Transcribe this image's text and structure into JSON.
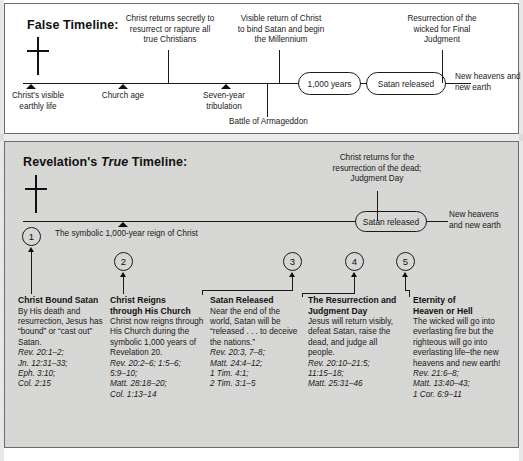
{
  "false_timeline": {
    "title": "False Timeline:",
    "cross_icon": "cross-icon",
    "above_labels": [
      "Christ returns secretly to\nresurrect or rapture all\ntrue Christians",
      "Visible return of Christ\nto bind Satan and begin\nthe Millennium",
      "Resurrection of the\nwicked for Final\nJudgment"
    ],
    "below_labels": [
      "Christ's visible\nearthly life",
      "Church age",
      "Seven-year\ntribulation",
      "Battle of Armageddon"
    ],
    "pills": [
      "1,000 years",
      "Satan released"
    ],
    "end_label": "New heavens and\nnew earth"
  },
  "true_timeline": {
    "title_prefix": "Revelation's ",
    "title_em": "True",
    "title_suffix": " Timeline:",
    "cross_icon": "cross-icon",
    "above_label": "Christ returns for the\nresurrection of the dead;\nJudgment Day",
    "reign_label": "The symbolic 1,000-year reign of Christ",
    "pill": "Satan released",
    "end_label": "New heavens\nand new earth",
    "markers": [
      "1",
      "2",
      "3",
      "4",
      "5"
    ]
  },
  "columns": [
    {
      "number": "1",
      "heading": "Christ Bound Satan",
      "body": "By His death and\nresurrection, Jesus has\n“bound” or “cast out”\nSatan.",
      "refs": "Rev. 20:1–2;\nJn. 12:31–33;\nEph. 3:10;\nCol. 2:15"
    },
    {
      "number": "2",
      "heading": "Christ Reigns\nthrough His Church",
      "body": "Christ now reigns through\nHis Church during the\nsymbolic 1,000 years of\nRevelation 20.",
      "refs": "Rev. 20:2–6; 1:5–6;\n5:9–10;\nMatt. 28:18–20;\nCol. 1:13–14"
    },
    {
      "number": "3",
      "heading": "Satan Released",
      "body": "Near the end of the\nworld, Satan will be\n“released . . . to deceive\nthe nations.”",
      "refs": "Rev. 20:3, 7–8;\nMatt. 24:4–12;\n1 Tim. 4:1;\n2 Tim. 3:1–5"
    },
    {
      "number": "4",
      "heading": "The Resurrection and\nJudgment Day",
      "body": "Jesus will return visibly,\ndefeat Satan, raise the\ndead, and judge all\npeople.",
      "refs": "Rev. 20:10–21:5;\n11:15–18;\nMatt. 25:31–46"
    },
    {
      "number": "5",
      "heading": "Eternity of\nHeaven or Hell",
      "body": "The wicked will go into\neverlasting fire but the\nrighteous will go into\neverlasting life–the new\nheavens and new earth!",
      "refs": "Rev. 21:6–8;\nMatt. 13:40–43;\n1 Cor. 6:9–11"
    }
  ],
  "caption": {
    "text": ""
  },
  "colors": {
    "ink": "#1a1a1a",
    "panel_false_bg": "#ffffff",
    "panel_true_bg": "#d8d8d6",
    "border": "#6d6d6d"
  }
}
